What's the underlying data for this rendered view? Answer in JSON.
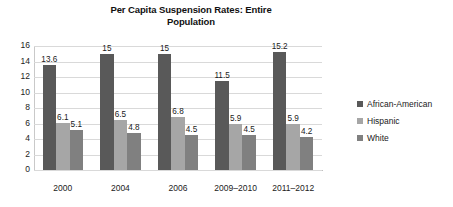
{
  "chart_data": {
    "type": "bar",
    "title": "Per Capita Suspension Rates: Entire Population",
    "title_line1": "Per Capita Suspension Rates: Entire",
    "title_line2": "Population",
    "xlabel": "",
    "ylabel": "",
    "ylim": [
      0,
      16
    ],
    "ytick_step": 2,
    "yticks": [
      "16",
      "14",
      "12",
      "10",
      "8",
      "6",
      "4",
      "2",
      "0"
    ],
    "grid": true,
    "legend_position": "right",
    "categories": [
      "2000",
      "2004",
      "2006",
      "2009–2010",
      "2011–2012"
    ],
    "series": [
      {
        "name": "African-American",
        "color": "#595959",
        "values": [
          13.6,
          15,
          15,
          11.5,
          15.2
        ],
        "labels": [
          "13.6",
          "15",
          "15",
          "11.5",
          "15.2"
        ]
      },
      {
        "name": "Hispanic",
        "color": "#a6a6a6",
        "values": [
          6.1,
          6.5,
          6.8,
          5.9,
          5.9
        ],
        "labels": [
          "6.1",
          "6.5",
          "6.8",
          "5.9",
          "5.9"
        ]
      },
      {
        "name": "White",
        "color": "#808080",
        "values": [
          5.1,
          4.8,
          4.5,
          4.5,
          4.2
        ],
        "labels": [
          "5.1",
          "4.8",
          "4.5",
          "4.5",
          "4.2"
        ]
      }
    ]
  }
}
